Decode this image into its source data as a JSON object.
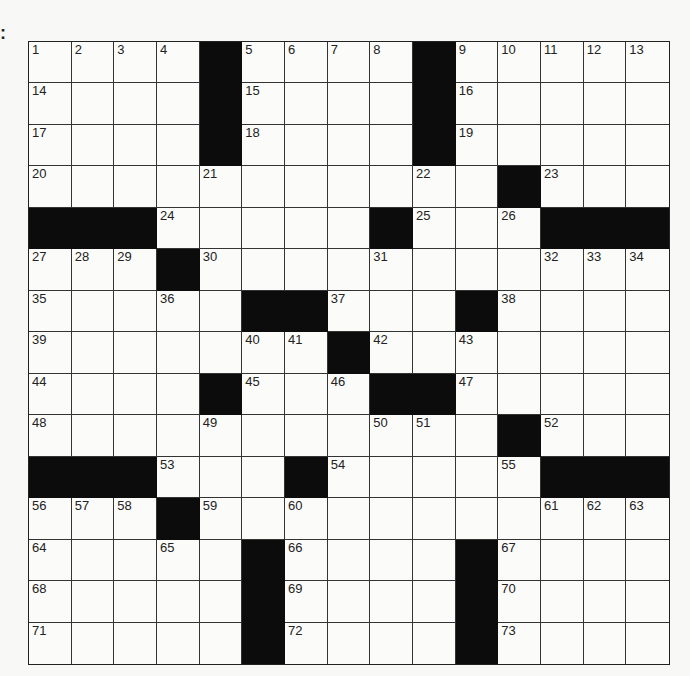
{
  "puzzle": {
    "corner_mark": ":",
    "rows": 15,
    "cols": 15,
    "colors": {
      "block": "#0c0c0c",
      "cell": "#fbfbf9",
      "line": "#333333",
      "number": "#222222"
    },
    "grid": [
      [
        "1",
        "2",
        "3",
        "4",
        "#",
        "5",
        "6",
        "7",
        "8",
        "#",
        "9",
        "10",
        "11",
        "12",
        "13"
      ],
      [
        "14",
        "",
        "",
        "",
        "#",
        "15",
        "",
        "",
        "",
        "#",
        "16",
        "",
        "",
        "",
        ""
      ],
      [
        "17",
        "",
        "",
        "",
        "#",
        "18",
        "",
        "",
        "",
        "#",
        "19",
        "",
        "",
        "",
        ""
      ],
      [
        "20",
        "",
        "",
        "",
        "21",
        "",
        "",
        "",
        "",
        "22",
        "",
        "#",
        "23",
        "",
        ""
      ],
      [
        "#",
        "#",
        "#",
        "24",
        "",
        "",
        "",
        "",
        "#",
        "25",
        "",
        "26",
        "#",
        "#",
        "#"
      ],
      [
        "27",
        "28",
        "29",
        "#",
        "30",
        "",
        "",
        "",
        "31",
        "",
        "",
        "",
        "32",
        "33",
        "34"
      ],
      [
        "35",
        "",
        "",
        "36",
        "",
        "#",
        "#",
        "37",
        "",
        "",
        "#",
        "38",
        "",
        "",
        ""
      ],
      [
        "39",
        "",
        "",
        "",
        "",
        "40",
        "41",
        "#",
        "42",
        "",
        "43",
        "",
        "",
        "",
        ""
      ],
      [
        "44",
        "",
        "",
        "",
        "#",
        "45",
        "",
        "46",
        "#",
        "#",
        "47",
        "",
        "",
        "",
        ""
      ],
      [
        "48",
        "",
        "",
        "",
        "49",
        "",
        "",
        "",
        "50",
        "51",
        "",
        "#",
        "52",
        "",
        ""
      ],
      [
        "#",
        "#",
        "#",
        "53",
        "",
        "",
        "#",
        "54",
        "",
        "",
        "",
        "55",
        "#",
        "#",
        "#"
      ],
      [
        "56",
        "57",
        "58",
        "#",
        "59",
        "",
        "60",
        "",
        "",
        "",
        "",
        "",
        "61",
        "62",
        "63"
      ],
      [
        "64",
        "",
        "",
        "65",
        "",
        "#",
        "66",
        "",
        "",
        "",
        "#",
        "67",
        "",
        "",
        ""
      ],
      [
        "68",
        "",
        "",
        "",
        "",
        "#",
        "69",
        "",
        "",
        "",
        "#",
        "70",
        "",
        "",
        ""
      ],
      [
        "71",
        "",
        "",
        "",
        "",
        "#",
        "72",
        "",
        "",
        "",
        "#",
        "73",
        "",
        "",
        ""
      ]
    ]
  }
}
